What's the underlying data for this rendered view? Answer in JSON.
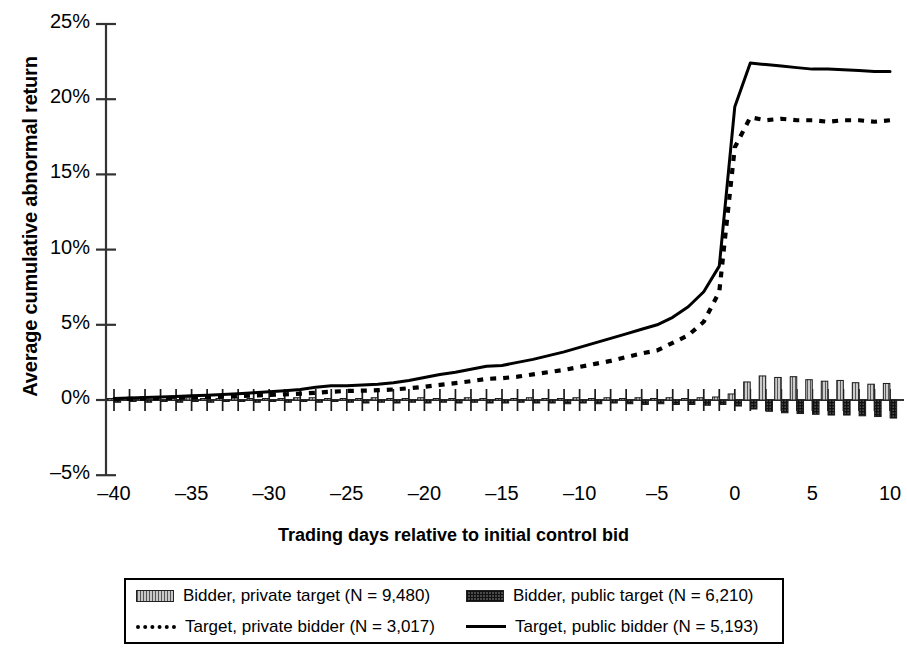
{
  "chart_data": {
    "type": "bar",
    "title": "",
    "xlabel": "Trading days relative to initial control bid",
    "ylabel": "Average cumulative abnormal return",
    "xlim": [
      -40.5,
      10.5
    ],
    "ylim": [
      -5,
      25
    ],
    "x_tick_labels": [
      "–40",
      "–35",
      "–30",
      "–25",
      "–20",
      "–15",
      "–10",
      "–5",
      "0",
      "5",
      "10"
    ],
    "x_ticks": [
      -40,
      -35,
      -30,
      -25,
      -20,
      -15,
      -10,
      -5,
      0,
      5,
      10
    ],
    "y_tick_labels": [
      "25%",
      "20%",
      "15%",
      "10%",
      "5%",
      "0%",
      "–5%"
    ],
    "y_ticks": [
      25,
      20,
      15,
      10,
      5,
      0,
      -5
    ],
    "grid": false,
    "legend_position": "below",
    "x": [
      -40,
      -39,
      -38,
      -37,
      -36,
      -35,
      -34,
      -33,
      -32,
      -31,
      -30,
      -29,
      -28,
      -27,
      -26,
      -25,
      -24,
      -23,
      -22,
      -21,
      -20,
      -19,
      -18,
      -17,
      -16,
      -15,
      -14,
      -13,
      -12,
      -11,
      -10,
      -9,
      -8,
      -7,
      -6,
      -5,
      -4,
      -3,
      -2,
      -1,
      0,
      1,
      2,
      3,
      4,
      5,
      6,
      7,
      8,
      9,
      10
    ],
    "series": [
      {
        "name": "Bidder, private target (N = 9,480)",
        "type": "bar",
        "style": "light-hatched",
        "values": [
          0.1,
          0.1,
          0.1,
          0.15,
          0.1,
          0.15,
          0.1,
          0.1,
          0.15,
          0.1,
          0.1,
          0.1,
          0.15,
          0.15,
          0.1,
          0.1,
          0.1,
          0.15,
          0.1,
          0.1,
          0.15,
          0.1,
          0.1,
          0.15,
          0.1,
          0.1,
          0.1,
          0.15,
          0.1,
          0.1,
          0.15,
          0.1,
          0.15,
          0.1,
          0.15,
          0.1,
          0.15,
          0.1,
          0.15,
          0.2,
          0.4,
          1.2,
          1.6,
          1.5,
          1.55,
          1.35,
          1.25,
          1.3,
          1.15,
          1.05,
          1.1
        ]
      },
      {
        "name": "Bidder, public target (N = 6,210)",
        "type": "bar",
        "style": "dark-hatched",
        "values": [
          -0.15,
          -0.1,
          -0.15,
          -0.1,
          -0.15,
          -0.1,
          -0.15,
          -0.1,
          -0.1,
          -0.15,
          -0.1,
          -0.15,
          -0.1,
          -0.15,
          -0.1,
          -0.15,
          -0.2,
          -0.15,
          -0.2,
          -0.15,
          -0.2,
          -0.15,
          -0.2,
          -0.15,
          -0.2,
          -0.2,
          -0.15,
          -0.2,
          -0.2,
          -0.25,
          -0.2,
          -0.25,
          -0.2,
          -0.25,
          -0.3,
          -0.25,
          -0.3,
          -0.3,
          -0.35,
          -0.3,
          -0.4,
          -0.6,
          -0.75,
          -0.85,
          -0.9,
          -0.95,
          -1.0,
          -1.0,
          -1.05,
          -1.1,
          -1.2
        ]
      },
      {
        "name": "Target, private bidder (N = 3,017)",
        "type": "line",
        "style": "dashed",
        "values": [
          0.05,
          0.08,
          0.1,
          0.12,
          0.15,
          0.18,
          0.2,
          0.23,
          0.26,
          0.3,
          0.33,
          0.38,
          0.42,
          0.48,
          0.55,
          0.6,
          0.62,
          0.65,
          0.7,
          0.78,
          0.88,
          1.0,
          1.12,
          1.25,
          1.4,
          1.45,
          1.55,
          1.7,
          1.85,
          2.0,
          2.2,
          2.4,
          2.6,
          2.85,
          3.1,
          3.3,
          3.8,
          4.3,
          5.2,
          7.2,
          16.8,
          18.8,
          18.6,
          18.7,
          18.6,
          18.6,
          18.5,
          18.6,
          18.6,
          18.5,
          18.6
        ]
      },
      {
        "name": "Target, public bidder (N = 5,193)",
        "type": "line",
        "style": "solid",
        "values": [
          0.1,
          0.13,
          0.16,
          0.2,
          0.24,
          0.28,
          0.32,
          0.36,
          0.42,
          0.48,
          0.55,
          0.62,
          0.7,
          0.85,
          0.95,
          0.95,
          1.0,
          1.05,
          1.15,
          1.3,
          1.5,
          1.7,
          1.85,
          2.05,
          2.25,
          2.3,
          2.5,
          2.7,
          2.95,
          3.2,
          3.5,
          3.8,
          4.1,
          4.4,
          4.7,
          5.0,
          5.5,
          6.2,
          7.2,
          8.9,
          19.5,
          22.4,
          22.3,
          22.2,
          22.1,
          22.0,
          22.0,
          21.95,
          21.9,
          21.85,
          21.85
        ]
      }
    ]
  },
  "legend": {
    "entries": [
      {
        "label": "Bidder, private target (N = 9,480)",
        "swatch": "light-hatched-swatch"
      },
      {
        "label": "Bidder, public target (N = 6,210)",
        "swatch": "dark-hatched-swatch"
      },
      {
        "label": "Target, private bidder (N = 3,017)",
        "swatch": "dashed-line-swatch"
      },
      {
        "label": "Target, public bidder (N = 5,193)",
        "swatch": "solid-line-swatch"
      }
    ]
  }
}
